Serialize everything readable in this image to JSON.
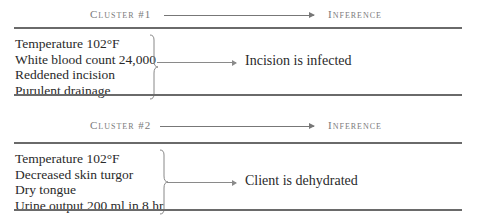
{
  "clusters": [
    {
      "header": {
        "cluster_label": "Cluster #1",
        "inference_label": "Inference"
      },
      "cues": [
        "Temperature 102°F",
        "White blood count 24,000",
        "Reddened incision",
        "Purulent drainage"
      ],
      "inference": "Incision is infected"
    },
    {
      "header": {
        "cluster_label": "Cluster #2",
        "inference_label": "Inference"
      },
      "cues": [
        "Temperature 102°F",
        "Decreased skin turgor",
        "Dry tongue",
        "Urine output 200 ml in 8 hr"
      ],
      "inference": "Client is dehydrated"
    }
  ]
}
